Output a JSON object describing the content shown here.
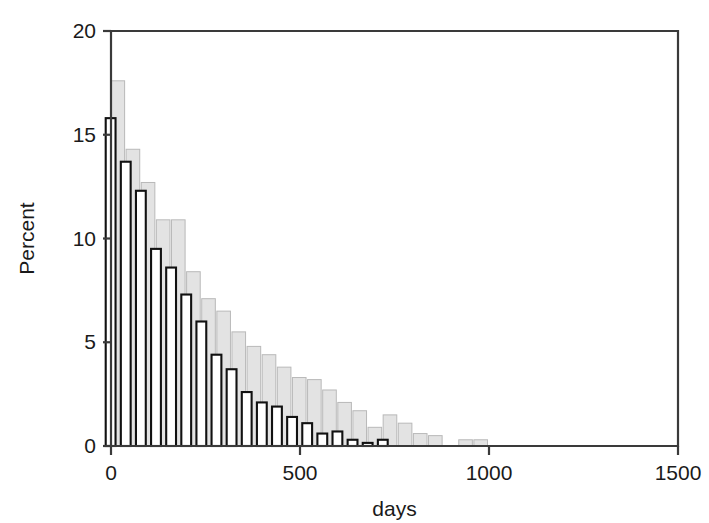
{
  "chart_data": {
    "type": "bar",
    "title": "",
    "subtitle": "",
    "xlabel": "days",
    "ylabel": "Percent",
    "xlim": [
      0,
      1500
    ],
    "ylim": [
      0,
      20
    ],
    "xticks": [
      0,
      500,
      1000,
      1500
    ],
    "xticklabels": [
      "0",
      "500",
      "1000",
      "1500"
    ],
    "yticks": [
      0,
      5,
      10,
      15,
      20
    ],
    "yticklabels": [
      "0",
      "5",
      "10",
      "15",
      "20"
    ],
    "grid": false,
    "legend": "none",
    "bin_width": 40,
    "bin_starts": [
      0,
      40,
      80,
      120,
      160,
      200,
      240,
      280,
      320,
      360,
      400,
      440,
      480,
      520,
      560,
      600,
      640,
      680,
      720,
      760,
      800,
      840,
      880,
      920,
      960,
      1000,
      1040
    ],
    "series": [
      {
        "name": "series-back-gray",
        "style": "filled-gray",
        "offset_days": 0,
        "bar_width_days": 36,
        "values": [
          17.6,
          14.3,
          12.7,
          10.9,
          10.9,
          8.4,
          7.1,
          6.5,
          5.5,
          4.8,
          4.4,
          3.8,
          3.3,
          3.2,
          2.7,
          2.1,
          1.7,
          0.9,
          1.5,
          1.1,
          0.6,
          0.5,
          0.0,
          0.3,
          0.3,
          0.0,
          0.0
        ]
      },
      {
        "name": "series-front-outline",
        "style": "white-outlined",
        "offset_days": -14,
        "bar_width_days": 26,
        "values": [
          15.8,
          13.7,
          12.3,
          9.5,
          8.6,
          7.3,
          6.0,
          4.4,
          3.7,
          2.6,
          2.1,
          1.9,
          1.4,
          1.1,
          0.6,
          0.7,
          0.3,
          0.15,
          0.3,
          0.0,
          0.0,
          0.0,
          0.0,
          0.0,
          0.0,
          0.0,
          0.0
        ]
      }
    ]
  },
  "colors": {
    "bar_gray_fill": "#e3e3e3",
    "bar_gray_edge": "#b9b9b9",
    "bar_white_fill": "#ffffff",
    "bar_white_edge": "#111111",
    "axis": "#3a3a3a",
    "text": "#1a1a1a",
    "background": "#ffffff"
  }
}
